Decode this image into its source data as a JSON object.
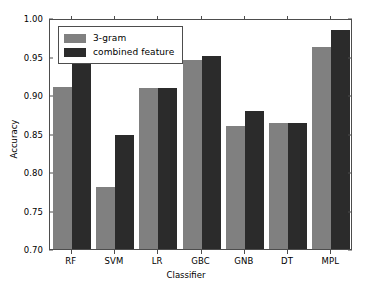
{
  "chart_data": {
    "type": "bar",
    "title": "",
    "xlabel": "Classifier",
    "ylabel": "Accuracy",
    "categories": [
      "RF",
      "SVM",
      "LR",
      "GBC",
      "GNB",
      "DT",
      "MPL"
    ],
    "series": [
      {
        "name": "3-gram",
        "color": "#808080",
        "values": [
          0.91,
          0.78,
          0.909,
          0.945,
          0.86,
          0.864,
          0.963
        ]
      },
      {
        "name": "combined feature",
        "color": "#2b2b2b",
        "values": [
          0.949,
          0.848,
          0.909,
          0.951,
          0.879,
          0.864,
          0.985
        ]
      }
    ],
    "ylim": [
      0.7,
      1.0
    ],
    "yticks": [
      0.7,
      0.75,
      0.8,
      0.85,
      0.9,
      0.95,
      1.0
    ],
    "ytick_labels": [
      "0.70",
      "0.75",
      "0.80",
      "0.85",
      "0.90",
      "0.95",
      "1.00"
    ],
    "grid": false,
    "legend_position": "upper left",
    "bar_width_px": 19,
    "group_gap_px": 4
  },
  "legend": {
    "entries": [
      {
        "label": "3-gram",
        "color": "#808080"
      },
      {
        "label": "combined feature",
        "color": "#2b2b2b"
      }
    ]
  },
  "axes": {
    "ylabel": "Accuracy",
    "xlabel": "Classifier"
  }
}
